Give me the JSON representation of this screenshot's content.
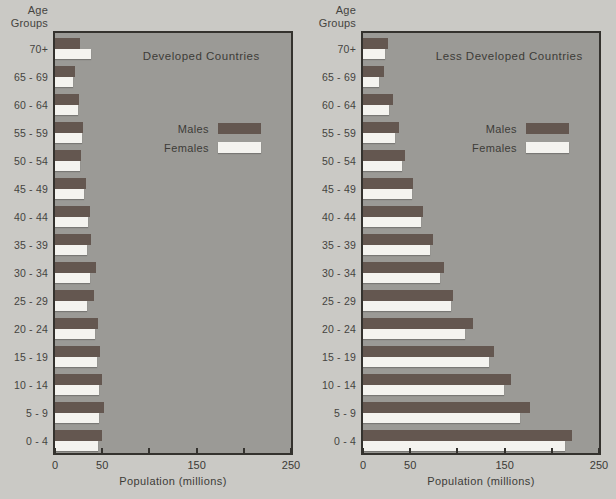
{
  "colors": {
    "page_background": "#cac9c5",
    "plot_background": "#9b9a96",
    "male_bar": "#645750",
    "female_bar": "#f4f3ef",
    "axis_line": "#34322e",
    "text": "#45443f"
  },
  "labels": {
    "age_header_line1": "Age",
    "age_header_line2": "Groups",
    "x_axis_title": "Population (millions)",
    "legend_males": "Males",
    "legend_females": "Females"
  },
  "chart_data": [
    {
      "type": "bar",
      "orientation": "horizontal",
      "title": "Developed Countries",
      "xlabel": "Population (millions)",
      "ylabel": "Age Groups",
      "xlim": [
        0,
        250
      ],
      "x_ticks": [
        0,
        50,
        100,
        150,
        200,
        250
      ],
      "x_tick_labels_shown": [
        0,
        50,
        150,
        250
      ],
      "grid": false,
      "legend_position": "inside-upper-right",
      "categories": [
        "70+",
        "65 - 69",
        "60 - 64",
        "55 - 59",
        "50 - 54",
        "45 - 49",
        "40 - 44",
        "35 - 39",
        "30 - 34",
        "25 - 29",
        "20 - 24",
        "15 - 19",
        "10 - 14",
        "5 - 9",
        "0 - 4"
      ],
      "series": [
        {
          "name": "Males",
          "color": "#645750",
          "values": [
            27,
            21,
            25,
            30,
            28,
            33,
            37,
            38,
            43,
            41,
            46,
            48,
            50,
            52,
            50
          ]
        },
        {
          "name": "Females",
          "color": "#f4f3ef",
          "values": [
            38,
            19,
            24,
            29,
            27,
            31,
            35,
            34,
            37,
            34,
            42,
            45,
            47,
            47,
            46
          ]
        }
      ]
    },
    {
      "type": "bar",
      "orientation": "horizontal",
      "title": "Less Developed Countries",
      "xlabel": "Population (millions)",
      "ylabel": "Age Groups",
      "xlim": [
        0,
        250
      ],
      "x_ticks": [
        0,
        50,
        100,
        150,
        200,
        250
      ],
      "x_tick_labels_shown": [
        0,
        50,
        150,
        250
      ],
      "grid": false,
      "legend_position": "inside-upper-right",
      "categories": [
        "70+",
        "65 - 69",
        "60 - 64",
        "55 - 59",
        "50 - 54",
        "45 - 49",
        "40 - 44",
        "35 - 39",
        "30 - 34",
        "25 - 29",
        "20 - 24",
        "15 - 19",
        "10 - 14",
        "5 - 9",
        "0 - 4"
      ],
      "series": [
        {
          "name": "Males",
          "color": "#645750",
          "values": [
            26,
            22,
            32,
            38,
            44,
            53,
            64,
            74,
            86,
            95,
            116,
            139,
            157,
            177,
            221
          ]
        },
        {
          "name": "Females",
          "color": "#f4f3ef",
          "values": [
            23,
            17,
            28,
            34,
            41,
            52,
            61,
            71,
            82,
            93,
            108,
            133,
            149,
            166,
            214
          ]
        }
      ]
    }
  ]
}
